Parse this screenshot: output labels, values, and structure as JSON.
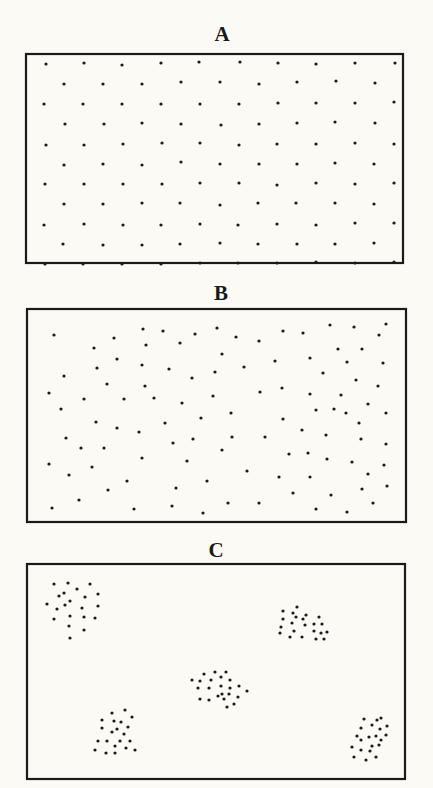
{
  "colors": {
    "background": "#fbfaf5",
    "ink": "#1a1a1a"
  },
  "panels": [
    {
      "label": "A",
      "pattern": "uniform",
      "label_pos": {
        "x": 222,
        "y": 24
      },
      "frame": {
        "x": 26,
        "y": 54,
        "w": 377,
        "h": 209
      },
      "dots": [
        [
          46,
          64
        ],
        [
          84,
          63
        ],
        [
          122,
          65
        ],
        [
          161,
          63
        ],
        [
          199,
          62
        ],
        [
          240,
          62
        ],
        [
          278,
          63
        ],
        [
          316,
          64
        ],
        [
          355,
          63
        ],
        [
          395,
          63
        ],
        [
          64,
          84
        ],
        [
          103,
          84
        ],
        [
          142,
          84
        ],
        [
          181,
          82
        ],
        [
          220,
          82
        ],
        [
          259,
          84
        ],
        [
          297,
          82
        ],
        [
          336,
          81
        ],
        [
          375,
          83
        ],
        [
          44,
          104
        ],
        [
          83,
          104
        ],
        [
          122,
          104
        ],
        [
          161,
          104
        ],
        [
          200,
          104
        ],
        [
          239,
          104
        ],
        [
          278,
          103
        ],
        [
          316,
          103
        ],
        [
          355,
          103
        ],
        [
          394,
          102
        ],
        [
          65,
          124
        ],
        [
          104,
          124
        ],
        [
          142,
          123
        ],
        [
          181,
          124
        ],
        [
          221,
          125
        ],
        [
          259,
          124
        ],
        [
          297,
          123
        ],
        [
          335,
          122
        ],
        [
          375,
          123
        ],
        [
          46,
          145
        ],
        [
          84,
          145
        ],
        [
          123,
          144
        ],
        [
          162,
          143
        ],
        [
          200,
          143
        ],
        [
          239,
          145
        ],
        [
          277,
          144
        ],
        [
          316,
          144
        ],
        [
          355,
          143
        ],
        [
          394,
          144
        ],
        [
          64,
          165
        ],
        [
          103,
          164
        ],
        [
          142,
          165
        ],
        [
          181,
          162
        ],
        [
          220,
          164
        ],
        [
          259,
          164
        ],
        [
          297,
          164
        ],
        [
          335,
          163
        ],
        [
          374,
          164
        ],
        [
          45,
          184
        ],
        [
          84,
          184
        ],
        [
          123,
          184
        ],
        [
          162,
          184
        ],
        [
          200,
          183
        ],
        [
          239,
          183
        ],
        [
          277,
          185
        ],
        [
          316,
          183
        ],
        [
          355,
          184
        ],
        [
          394,
          183
        ],
        [
          64,
          204
        ],
        [
          103,
          204
        ],
        [
          142,
          203
        ],
        [
          180,
          203
        ],
        [
          220,
          205
        ],
        [
          258,
          203
        ],
        [
          296,
          203
        ],
        [
          335,
          203
        ],
        [
          374,
          204
        ],
        [
          44,
          225
        ],
        [
          84,
          224
        ],
        [
          123,
          225
        ],
        [
          161,
          225
        ],
        [
          200,
          224
        ],
        [
          238,
          225
        ],
        [
          277,
          224
        ],
        [
          316,
          225
        ],
        [
          355,
          223
        ],
        [
          394,
          223
        ],
        [
          63,
          244
        ],
        [
          103,
          245
        ],
        [
          142,
          245
        ],
        [
          180,
          244
        ],
        [
          220,
          243
        ],
        [
          258,
          244
        ],
        [
          297,
          244
        ],
        [
          335,
          244
        ],
        [
          374,
          243
        ],
        [
          45,
          264
        ],
        [
          83,
          264
        ],
        [
          122,
          264
        ],
        [
          161,
          264
        ],
        [
          200,
          263
        ],
        [
          238,
          263
        ],
        [
          277,
          263
        ],
        [
          316,
          262
        ],
        [
          355,
          263
        ],
        [
          394,
          262
        ]
      ]
    },
    {
      "label": "B",
      "pattern": "random",
      "label_pos": {
        "x": 221,
        "y": 283
      },
      "frame": {
        "x": 27,
        "y": 309,
        "w": 379,
        "h": 213
      },
      "dots": [
        [
          54,
          335
        ],
        [
          143,
          329
        ],
        [
          163,
          331
        ],
        [
          195,
          334
        ],
        [
          217,
          328
        ],
        [
          114,
          338
        ],
        [
          94,
          348
        ],
        [
          146,
          345
        ],
        [
          180,
          343
        ],
        [
          117,
          359
        ],
        [
          97,
          368
        ],
        [
          142,
          365
        ],
        [
          169,
          369
        ],
        [
          64,
          376
        ],
        [
          192,
          378
        ],
        [
          215,
          372
        ],
        [
          107,
          384
        ],
        [
          145,
          386
        ],
        [
          49,
          393
        ],
        [
          84,
          399
        ],
        [
          124,
          399
        ],
        [
          154,
          398
        ],
        [
          213,
          396
        ],
        [
          182,
          403
        ],
        [
          61,
          409
        ],
        [
          236,
          337
        ],
        [
          259,
          341
        ],
        [
          283,
          331
        ],
        [
          303,
          333
        ],
        [
          330,
          325
        ],
        [
          354,
          327
        ],
        [
          386,
          324
        ],
        [
          379,
          335
        ],
        [
          222,
          354
        ],
        [
          338,
          349
        ],
        [
          362,
          349
        ],
        [
          275,
          361
        ],
        [
          310,
          358
        ],
        [
          244,
          367
        ],
        [
          347,
          362
        ],
        [
          383,
          363
        ],
        [
          323,
          373
        ],
        [
          356,
          380
        ],
        [
          378,
          386
        ],
        [
          260,
          392
        ],
        [
          282,
          388
        ],
        [
          310,
          394
        ],
        [
          341,
          395
        ],
        [
          368,
          404
        ],
        [
          316,
          410
        ],
        [
          334,
          409
        ],
        [
          231,
          413
        ],
        [
          386,
          413
        ],
        [
          96,
          422
        ],
        [
          117,
          428
        ],
        [
          139,
          432
        ],
        [
          165,
          423
        ],
        [
          201,
          418
        ],
        [
          66,
          438
        ],
        [
          81,
          448
        ],
        [
          104,
          448
        ],
        [
          173,
          443
        ],
        [
          193,
          439
        ],
        [
          49,
          464
        ],
        [
          92,
          467
        ],
        [
          142,
          458
        ],
        [
          187,
          461
        ],
        [
          69,
          475
        ],
        [
          127,
          481
        ],
        [
          108,
          490
        ],
        [
          176,
          488
        ],
        [
          207,
          481
        ],
        [
          79,
          500
        ],
        [
          52,
          508
        ],
        [
          134,
          509
        ],
        [
          172,
          506
        ],
        [
          203,
          513
        ],
        [
          283,
          419
        ],
        [
          346,
          413
        ],
        [
          359,
          423
        ],
        [
          232,
          437
        ],
        [
          265,
          437
        ],
        [
          302,
          430
        ],
        [
          326,
          435
        ],
        [
          361,
          439
        ],
        [
          386,
          444
        ],
        [
          222,
          450
        ],
        [
          289,
          454
        ],
        [
          308,
          453
        ],
        [
          327,
          459
        ],
        [
          352,
          462
        ],
        [
          384,
          465
        ],
        [
          247,
          471
        ],
        [
          279,
          477
        ],
        [
          310,
          477
        ],
        [
          368,
          474
        ],
        [
          362,
          489
        ],
        [
          387,
          486
        ],
        [
          293,
          493
        ],
        [
          331,
          495
        ],
        [
          228,
          503
        ],
        [
          259,
          503
        ],
        [
          373,
          503
        ],
        [
          316,
          509
        ],
        [
          347,
          512
        ]
      ]
    },
    {
      "label": "C",
      "pattern": "clumped",
      "label_pos": {
        "x": 216,
        "y": 540
      },
      "frame": {
        "x": 27,
        "y": 564,
        "w": 378,
        "h": 215
      },
      "clusters": [
        {
          "name": "top-left",
          "dots": [
            [
              54,
              584
            ],
            [
              68,
              583
            ],
            [
              90,
              584
            ],
            [
              77,
              589
            ],
            [
              64,
              593
            ],
            [
              59,
              596
            ],
            [
              85,
              597
            ],
            [
              98,
              594
            ],
            [
              47,
              604
            ],
            [
              57,
              609
            ],
            [
              65,
              605
            ],
            [
              70,
              601
            ],
            [
              82,
              608
            ],
            [
              98,
              606
            ],
            [
              70,
              616
            ],
            [
              84,
              617
            ],
            [
              95,
              618
            ],
            [
              54,
              619
            ],
            [
              69,
              626
            ],
            [
              84,
              630
            ],
            [
              70,
              638
            ]
          ]
        },
        {
          "name": "top-right",
          "dots": [
            [
              283,
              611
            ],
            [
              297,
              607
            ],
            [
              293,
              613
            ],
            [
              283,
              619
            ],
            [
              296,
              617
            ],
            [
              303,
              619
            ],
            [
              306,
              615
            ],
            [
              319,
              617
            ],
            [
              292,
              623
            ],
            [
              305,
              625
            ],
            [
              314,
              624
            ],
            [
              322,
              624
            ],
            [
              281,
              627
            ],
            [
              280,
              633
            ],
            [
              294,
              631
            ],
            [
              314,
              631
            ],
            [
              321,
              633
            ],
            [
              327,
              632
            ],
            [
              290,
              637
            ],
            [
              302,
              637
            ],
            [
              316,
              639
            ],
            [
              324,
              639
            ]
          ]
        },
        {
          "name": "center",
          "dots": [
            [
              204,
              674
            ],
            [
              215,
              672
            ],
            [
              226,
              672
            ],
            [
              221,
              677
            ],
            [
              192,
              680
            ],
            [
              200,
              681
            ],
            [
              211,
              680
            ],
            [
              230,
              680
            ],
            [
              198,
              688
            ],
            [
              209,
              688
            ],
            [
              221,
              686
            ],
            [
              230,
              688
            ],
            [
              239,
              686
            ],
            [
              247,
              691
            ],
            [
              222,
              694
            ],
            [
              229,
              694
            ],
            [
              200,
              699
            ],
            [
              209,
              700
            ],
            [
              218,
              696
            ],
            [
              224,
              699
            ],
            [
              238,
              697
            ],
            [
              234,
              704
            ],
            [
              227,
              707
            ]
          ]
        },
        {
          "name": "bottom-left",
          "dots": [
            [
              125,
              710
            ],
            [
              112,
              713
            ],
            [
              132,
              717
            ],
            [
              102,
              720
            ],
            [
              114,
              721
            ],
            [
              121,
              722
            ],
            [
              102,
              728
            ],
            [
              117,
              729
            ],
            [
              128,
              727
            ],
            [
              112,
              732
            ],
            [
              124,
              734
            ],
            [
              98,
              741
            ],
            [
              107,
              741
            ],
            [
              120,
              741
            ],
            [
              130,
              741
            ],
            [
              115,
              746
            ],
            [
              126,
              748
            ],
            [
              95,
              750
            ],
            [
              106,
              753
            ],
            [
              115,
              753
            ],
            [
              135,
              750
            ]
          ]
        },
        {
          "name": "bottom-right",
          "dots": [
            [
              364,
              719
            ],
            [
              377,
              720
            ],
            [
              381,
              718
            ],
            [
              361,
              728
            ],
            [
              372,
              725
            ],
            [
              380,
              729
            ],
            [
              387,
              726
            ],
            [
              357,
              736
            ],
            [
              369,
              737
            ],
            [
              376,
              736
            ],
            [
              361,
              740
            ],
            [
              381,
              740
            ],
            [
              386,
              735
            ],
            [
              352,
              747
            ],
            [
              372,
              746
            ],
            [
              379,
              745
            ],
            [
              361,
              750
            ],
            [
              370,
              751
            ],
            [
              354,
              757
            ],
            [
              376,
              757
            ],
            [
              366,
              760
            ]
          ]
        }
      ]
    }
  ]
}
